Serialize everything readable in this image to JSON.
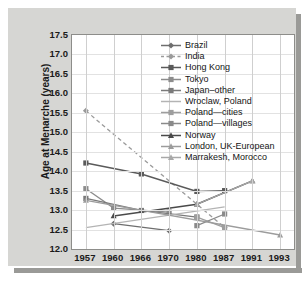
{
  "chart_data": {
    "type": "line",
    "title": "",
    "xlabel": "",
    "ylabel": "Age at Menarche (years)",
    "categories": [
      "1957",
      "1960",
      "1966",
      "1970",
      "1980",
      "1987",
      "1991",
      "1993"
    ],
    "ylim": [
      12.0,
      17.5
    ],
    "ytick_labels": [
      "12.0",
      "12.5",
      "13.0",
      "13.5",
      "14.0",
      "14.5",
      "15.0",
      "15.5",
      "16.0",
      "16.5",
      "17.0",
      "17.5"
    ],
    "ytick_values": [
      12.0,
      12.5,
      13.0,
      13.5,
      14.0,
      14.5,
      15.0,
      15.5,
      16.0,
      16.5,
      17.0,
      17.5
    ],
    "grid": true,
    "legend_position": "upper right",
    "series": [
      {
        "name": "Brazil",
        "marker": "diamond",
        "linestyle": "solid",
        "color": "#6e6e6e",
        "points": [
          {
            "x": "1960",
            "y": 12.65
          },
          {
            "x": "1970",
            "y": 12.47
          }
        ]
      },
      {
        "name": "India",
        "marker": "diamond",
        "linestyle": "dashed",
        "color": "#9a9a9a",
        "points": [
          {
            "x": "1957",
            "y": 15.55
          },
          {
            "x": "1987",
            "y": 12.55
          }
        ]
      },
      {
        "name": "Hong Kong",
        "marker": "square",
        "linestyle": "solid",
        "color": "#5a5a5a",
        "points": [
          {
            "x": "1957",
            "y": 14.21
          },
          {
            "x": "1966",
            "y": 13.93
          },
          {
            "x": "1980",
            "y": 13.48
          },
          {
            "x": "1987",
            "y": 13.5
          }
        ]
      },
      {
        "name": "Tokyo",
        "marker": "square",
        "linestyle": "solid",
        "color": "#8c8c8c",
        "points": [
          {
            "x": "1957",
            "y": 13.55
          },
          {
            "x": "1960",
            "y": 13.05
          },
          {
            "x": "1970",
            "y": 12.95
          }
        ]
      },
      {
        "name": "Japan–other",
        "marker": "square",
        "linestyle": "solid",
        "color": "#7a7a7a",
        "points": [
          {
            "x": "1957",
            "y": 13.3
          },
          {
            "x": "1966",
            "y": 12.99
          },
          {
            "x": "1980",
            "y": 12.82
          }
        ]
      },
      {
        "name": "Wroclaw, Poland",
        "marker": "none",
        "linestyle": "solid",
        "color": "#b4b4b4",
        "points": [
          {
            "x": "1957",
            "y": 12.55
          },
          {
            "x": "1987",
            "y": 13.08
          }
        ]
      },
      {
        "name": "Poland—cities",
        "marker": "square",
        "linestyle": "solid",
        "color": "#9e9e9e",
        "points": [
          {
            "x": "1980",
            "y": 12.82
          },
          {
            "x": "1987",
            "y": 12.55
          }
        ]
      },
      {
        "name": "Poland—villages",
        "marker": "square",
        "linestyle": "solid",
        "color": "#8a8a8a",
        "points": [
          {
            "x": "1980",
            "y": 12.6
          },
          {
            "x": "1987",
            "y": 12.9
          }
        ]
      },
      {
        "name": "Norway",
        "marker": "triangle",
        "linestyle": "solid",
        "color": "#4a4a4a",
        "points": [
          {
            "x": "1960",
            "y": 12.85
          },
          {
            "x": "1980",
            "y": 13.15
          },
          {
            "x": "1991",
            "y": 13.75
          }
        ]
      },
      {
        "name": "London, UK-European",
        "marker": "triangle",
        "linestyle": "solid",
        "color": "#9c9c9c",
        "points": [
          {
            "x": "1957",
            "y": 13.25
          },
          {
            "x": "1993",
            "y": 12.36
          }
        ]
      },
      {
        "name": "Marrakesh, Morocco",
        "marker": "triangle",
        "linestyle": "solid",
        "color": "#a8a8a8",
        "points": [
          {
            "x": "1980",
            "y": 13.15
          },
          {
            "x": "1991",
            "y": 13.75
          }
        ]
      }
    ]
  },
  "axes": {
    "y_title": "Age at Menarche (years)"
  },
  "colors": {
    "panel_background": "#d6d6d3",
    "plot_background": "#ffffff",
    "grid": "#cfcfcf",
    "axis_border": "#8d8d8a",
    "text": "#1a1a1a"
  }
}
